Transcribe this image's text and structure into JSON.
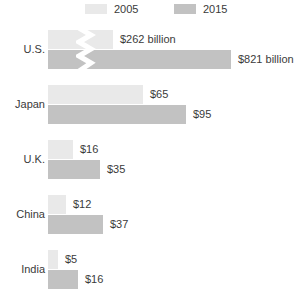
{
  "legend": {
    "entries": [
      {
        "label": "2005",
        "color": "#e9e9e9",
        "icon": "legend-swatch-icon"
      },
      {
        "label": "2015",
        "color": "#c2c2c2",
        "icon": "legend-swatch-icon"
      }
    ]
  },
  "colors": {
    "series_2005": "#e9e9e9",
    "series_2015": "#c2c2c2",
    "text": "#3a3a3a",
    "background": "#ffffff",
    "axis_break": "#ffffff"
  },
  "rows": [
    {
      "label": "U.S.",
      "upper": {
        "value_label": "$262 billion",
        "bar_px": 65,
        "broken": true
      },
      "lower": {
        "value_label": "$821 billion",
        "bar_px": 183,
        "broken": true
      }
    },
    {
      "label": "Japan",
      "upper": {
        "value_label": "$65",
        "bar_px": 95,
        "broken": false
      },
      "lower": {
        "value_label": "$95",
        "bar_px": 138,
        "broken": false
      }
    },
    {
      "label": "U.K.",
      "upper": {
        "value_label": "$16",
        "bar_px": 25,
        "broken": false
      },
      "lower": {
        "value_label": "$35",
        "bar_px": 52,
        "broken": false
      }
    },
    {
      "label": "China",
      "upper": {
        "value_label": "$12",
        "bar_px": 18,
        "broken": false
      },
      "lower": {
        "value_label": "$37",
        "bar_px": 55,
        "broken": false
      }
    },
    {
      "label": "India",
      "upper": {
        "value_label": "$5",
        "bar_px": 10,
        "broken": false
      },
      "lower": {
        "value_label": "$16",
        "bar_px": 30,
        "broken": false
      }
    }
  ],
  "axis_break": {
    "present": true,
    "row": "U.S.",
    "icon": "axis-break-zigzag-icon",
    "note": "white zigzag break across both U.S. bars"
  },
  "chart_data": {
    "type": "bar",
    "orientation": "horizontal",
    "title": "",
    "subtitle": "",
    "xlabel": "",
    "ylabel": "",
    "grid": false,
    "legend_position": "top",
    "broken_axis": true,
    "broken_axis_categories": [
      "U.S."
    ],
    "value_unit": "billion USD",
    "categories": [
      "U.S.",
      "Japan",
      "U.K.",
      "China",
      "India"
    ],
    "series": [
      {
        "name": "2005",
        "color": "#e9e9e9",
        "values": [
          262,
          65,
          16,
          12,
          5
        ]
      },
      {
        "name": "2015",
        "color": "#c2c2c2",
        "values": [
          821,
          95,
          35,
          37,
          16
        ]
      }
    ],
    "data_labels": [
      {
        "category": "U.S.",
        "series": "2005",
        "text": "$262 billion"
      },
      {
        "category": "U.S.",
        "series": "2015",
        "text": "$821 billion"
      },
      {
        "category": "Japan",
        "series": "2005",
        "text": "$65"
      },
      {
        "category": "Japan",
        "series": "2015",
        "text": "$95"
      },
      {
        "category": "U.K.",
        "series": "2005",
        "text": "$16"
      },
      {
        "category": "U.K.",
        "series": "2015",
        "text": "$35"
      },
      {
        "category": "China",
        "series": "2005",
        "text": "$12"
      },
      {
        "category": "China",
        "series": "2015",
        "text": "$37"
      },
      {
        "category": "India",
        "series": "2005",
        "text": "$5"
      },
      {
        "category": "India",
        "series": "2015",
        "text": "$16"
      }
    ],
    "annotations": [
      "axis break (zigzag) drawn through the U.S. bars"
    ]
  }
}
